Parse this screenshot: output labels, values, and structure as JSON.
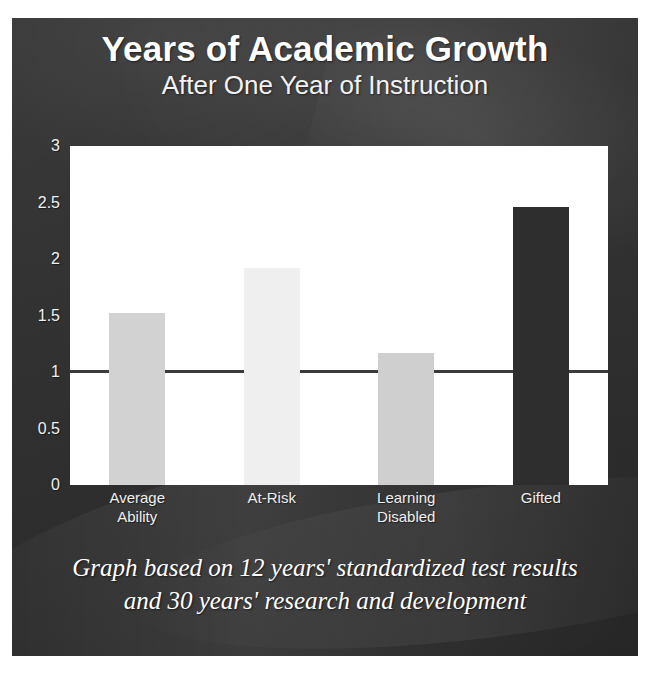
{
  "slide": {
    "title": "Years of Academic Growth",
    "subtitle": "After One Year of Instruction",
    "caption_line1": "Graph based on 12 years' standardized test results",
    "caption_line2": "and 30 years' research and development",
    "background_color": "#323232",
    "title_color": "#ffffff",
    "plot_background": "#ffffff"
  },
  "chart_data": {
    "type": "bar",
    "title": "Years of Academic Growth",
    "subtitle": "After One Year of Instruction",
    "xlabel": "",
    "ylabel": "",
    "categories": [
      "Average Ability",
      "At-Risk",
      "Learning Disabled",
      "Gifted"
    ],
    "category_lines": [
      [
        "Average",
        "Ability"
      ],
      [
        "At-Risk"
      ],
      [
        "Learning",
        "Disabled"
      ],
      [
        "Gifted"
      ]
    ],
    "values": [
      1.52,
      1.92,
      1.17,
      2.46
    ],
    "ylim": [
      0,
      3
    ],
    "yticks": [
      "0",
      "0.5",
      "1",
      "1.5",
      "2",
      "2.5",
      "3"
    ],
    "ytick_values": [
      0,
      0.5,
      1,
      1.5,
      2,
      2.5,
      3
    ],
    "grid": false,
    "legend": "none",
    "reference_line": 1,
    "reference_line_color": "#3b3b3b",
    "bar_colors": [
      "#d2d2d2",
      "#efefef",
      "#cfcfcf",
      "#2e2e2e"
    ]
  }
}
